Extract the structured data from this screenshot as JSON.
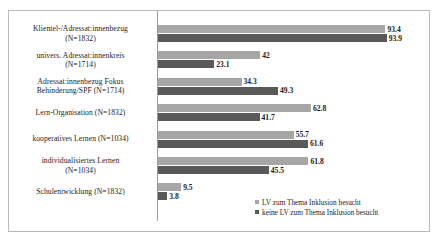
{
  "chart_data": {
    "type": "bar",
    "orientation": "horizontal",
    "title": "",
    "xlabel": "",
    "ylabel": "",
    "xlim": [
      0,
      100
    ],
    "grid": false,
    "legend_position": "bottom-right",
    "categories": [
      "Klientel-/Adressat:innenbezug (N=1832)",
      "univers. Adressat:innenkreis (N=1714)",
      "Adressat:innenbezug Fokus Behinderung/SPF (N=1714)",
      "Lern-Organisation (N=1832)",
      "kooperatives Lernen (N=1034)",
      "individualisiertes Lernen (N=1034)",
      "Schulentwicklung (N=1832)"
    ],
    "category_lines": [
      [
        "Klientel-/Adressat:innenbezug",
        "(N=1832)"
      ],
      [
        "univers. Adressat:innenkreis",
        "(N=1714)"
      ],
      [
        "Adressat:innenbezug Fokus",
        "Behinderung/SPF (N=1714)"
      ],
      [
        "Lern-Organisation (N=1832)"
      ],
      [
        "kooperatives Lernen (N=1034)"
      ],
      [
        "individualisiertes Lernen",
        "(N=1034)"
      ],
      [
        "Schulentwicklung (N=1832)"
      ]
    ],
    "series": [
      {
        "name": "LV zum Thema Inklusion besucht",
        "color": "#a6a6a6",
        "values": [
          93.4,
          42,
          34.3,
          62.8,
          55.7,
          61.8,
          9.5
        ],
        "labels": [
          "93.4",
          "42",
          "34.3",
          "62.8",
          "55.7",
          "61.8",
          "9.5"
        ]
      },
      {
        "name": "keine LV zum Thema Inklusion besucht",
        "color": "#595959",
        "values": [
          93.9,
          23.1,
          49.3,
          41.7,
          61.6,
          45.5,
          3.8
        ],
        "labels": [
          "93.9",
          "23.1",
          "49.3",
          "41.7",
          "61.6",
          "45.5",
          "3.8"
        ]
      }
    ]
  },
  "legend": {
    "items": [
      {
        "label": "LV zum Thema Inklusion besucht"
      },
      {
        "label": "keine LV zum Thema Inklusion besucht"
      }
    ]
  }
}
